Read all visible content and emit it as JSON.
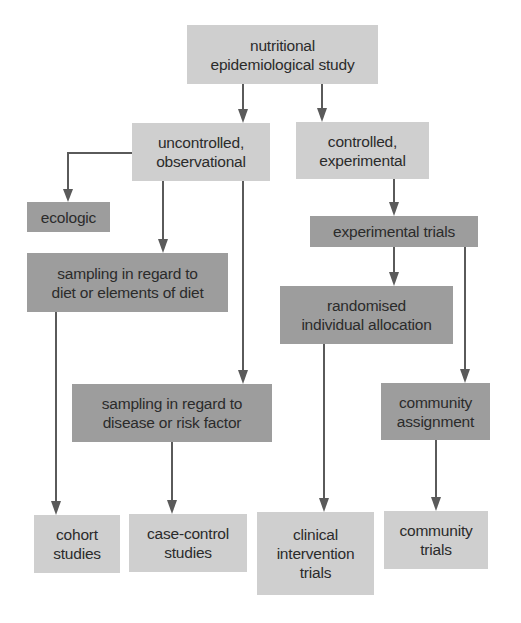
{
  "diagram": {
    "colors": {
      "light_box": "#cfcfcf",
      "dark_box": "#9d9d9d",
      "arrow": "#5a5a5a",
      "text": "#2b2b2b"
    },
    "nodes": {
      "root": {
        "label": "nutritional\nepidemiological study",
        "shade": "light"
      },
      "uncontrolled": {
        "label": "uncontrolled,\nobservational",
        "shade": "light"
      },
      "controlled": {
        "label": "controlled,\nexperimental",
        "shade": "light"
      },
      "ecologic": {
        "label": "ecologic",
        "shade": "dark"
      },
      "experimental_trials": {
        "label": "experimental trials",
        "shade": "dark"
      },
      "sampling_diet": {
        "label": "sampling in regard to\ndiet or elements of diet",
        "shade": "dark"
      },
      "randomised": {
        "label": "randomised\nindividual allocation",
        "shade": "dark"
      },
      "sampling_disease": {
        "label": "sampling in regard to\ndisease or risk factor",
        "shade": "dark"
      },
      "community_assignment": {
        "label": "community\nassignment",
        "shade": "dark"
      },
      "cohort": {
        "label": "cohort\nstudies",
        "shade": "light"
      },
      "case_control": {
        "label": "case-control\nstudies",
        "shade": "light"
      },
      "clinical": {
        "label": "clinical\nintervention\ntrials",
        "shade": "light"
      },
      "community_trials": {
        "label": "community\ntrials",
        "shade": "light"
      }
    },
    "edges": [
      [
        "root",
        "uncontrolled"
      ],
      [
        "root",
        "controlled"
      ],
      [
        "uncontrolled",
        "ecologic"
      ],
      [
        "uncontrolled",
        "sampling_diet"
      ],
      [
        "uncontrolled",
        "sampling_disease"
      ],
      [
        "controlled",
        "experimental_trials"
      ],
      [
        "experimental_trials",
        "randomised"
      ],
      [
        "experimental_trials",
        "community_assignment"
      ],
      [
        "sampling_diet",
        "cohort"
      ],
      [
        "sampling_disease",
        "case_control"
      ],
      [
        "randomised",
        "clinical"
      ],
      [
        "community_assignment",
        "community_trials"
      ]
    ]
  }
}
